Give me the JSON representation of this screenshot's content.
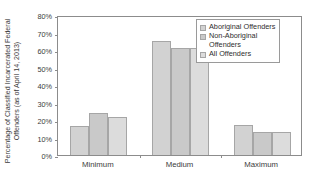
{
  "chart_data": {
    "type": "bar",
    "title": "",
    "xlabel": "",
    "ylabel": "Percentage of Classified Incarcerated Federal Offenders (as of April 14, 2013)",
    "ylabel_line1": "Percentage of Classified Incarcerated Federal",
    "ylabel_line2": "Offenders (as of April 14, 2013)",
    "categories": [
      "Minimum",
      "Medium",
      "Maximum"
    ],
    "ylim": [
      0,
      80
    ],
    "ytick_labels": [
      "0%",
      "10%",
      "20%",
      "30%",
      "40%",
      "50%",
      "60%",
      "70%",
      "80%"
    ],
    "ytick_values": [
      0,
      10,
      20,
      30,
      40,
      50,
      60,
      70,
      80
    ],
    "grid": false,
    "legend_position": "top-right",
    "series": [
      {
        "name": "Aboriginal Offenders",
        "values": [
          16.5,
          65,
          17
        ]
      },
      {
        "name": "Non-Aboriginal Offenders",
        "values": [
          24,
          61,
          13
        ]
      },
      {
        "name": "All Offenders",
        "values": [
          22,
          61,
          13
        ]
      }
    ]
  },
  "legend": {
    "entries": [
      {
        "label": "Aboriginal Offenders",
        "swatch": "legend-swatch-aboriginal"
      },
      {
        "label": "Non-Aboriginal\nOffenders",
        "swatch": "legend-swatch-non-aboriginal"
      },
      {
        "label": "All Offenders",
        "swatch": "legend-swatch-all"
      }
    ]
  },
  "colors": {
    "series_1": "#d2d2d2",
    "series_2": "#c9c9c9",
    "series_3": "#dcdcdc",
    "axis": "#8c8c8c",
    "text": "#3b3b3b",
    "background": "#ffffff"
  }
}
